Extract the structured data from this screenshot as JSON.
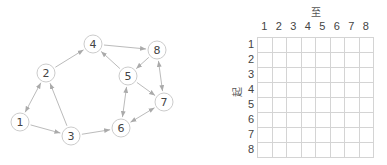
{
  "graph": {
    "nodes": [
      {
        "id": "1",
        "label": "1",
        "x": 20,
        "y": 122
      },
      {
        "id": "2",
        "label": "2",
        "x": 46,
        "y": 73
      },
      {
        "id": "3",
        "label": "3",
        "x": 71,
        "y": 136
      },
      {
        "id": "4",
        "label": "4",
        "x": 93,
        "y": 44
      },
      {
        "id": "5",
        "label": "5",
        "x": 128,
        "y": 76
      },
      {
        "id": "6",
        "label": "6",
        "x": 121,
        "y": 128
      },
      {
        "id": "7",
        "label": "7",
        "x": 164,
        "y": 102
      },
      {
        "id": "8",
        "label": "8",
        "x": 157,
        "y": 50
      }
    ],
    "edges": [
      {
        "from": "1",
        "to": "2",
        "bidirectional": true
      },
      {
        "from": "1",
        "to": "3",
        "bidirectional": false
      },
      {
        "from": "3",
        "to": "2",
        "bidirectional": false
      },
      {
        "from": "2",
        "to": "4",
        "bidirectional": false
      },
      {
        "from": "4",
        "to": "8",
        "bidirectional": false
      },
      {
        "from": "5",
        "to": "4",
        "bidirectional": false
      },
      {
        "from": "8",
        "to": "5",
        "bidirectional": false
      },
      {
        "from": "8",
        "to": "7",
        "bidirectional": true
      },
      {
        "from": "5",
        "to": "7",
        "bidirectional": false
      },
      {
        "from": "5",
        "to": "6",
        "bidirectional": true
      },
      {
        "from": "3",
        "to": "6",
        "bidirectional": false
      },
      {
        "from": "7",
        "to": "6",
        "bidirectional": true
      }
    ],
    "colors": {
      "node_stroke": "#cccccc",
      "edge": "#bbbbbb",
      "arrow": "#aaaaaa",
      "label": "#444444"
    }
  },
  "matrix": {
    "column_title": "至",
    "row_title": "起",
    "columns": [
      "1",
      "2",
      "3",
      "4",
      "5",
      "6",
      "7",
      "8"
    ],
    "rows": [
      "1",
      "2",
      "3",
      "4",
      "5",
      "6",
      "7",
      "8"
    ],
    "cells": [
      [
        "",
        "",
        "",
        "",
        "",
        "",
        "",
        ""
      ],
      [
        "",
        "",
        "",
        "",
        "",
        "",
        "",
        ""
      ],
      [
        "",
        "",
        "",
        "",
        "",
        "",
        "",
        ""
      ],
      [
        "",
        "",
        "",
        "",
        "",
        "",
        "",
        ""
      ],
      [
        "",
        "",
        "",
        "",
        "",
        "",
        "",
        ""
      ],
      [
        "",
        "",
        "",
        "",
        "",
        "",
        "",
        ""
      ],
      [
        "",
        "",
        "",
        "",
        "",
        "",
        "",
        ""
      ],
      [
        "",
        "",
        "",
        "",
        "",
        "",
        "",
        ""
      ]
    ]
  }
}
